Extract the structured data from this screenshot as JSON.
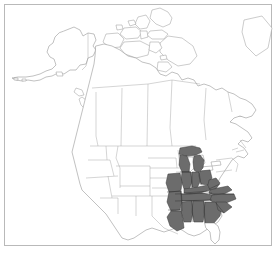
{
  "figure": {
    "kind": "distribution-range-map",
    "title": "",
    "caption": "",
    "width": 278,
    "height": 253
  },
  "frame": {
    "visible": true,
    "border_color": "#b9b9b9",
    "background_color": "#ffffff"
  },
  "style": {
    "background": "#ffffff",
    "coastline_stroke": "#8e8e8e",
    "admin_boundary_stroke": "#a2a2a2",
    "shaded_fill": "#6c6c6c",
    "shaded_stroke": "#3a3a3a",
    "unshaded_fill": "#ffffff"
  },
  "legend": {
    "visible": false,
    "entries": []
  },
  "map": {
    "extent_label": "North America",
    "projection_note": "",
    "regions": [
      {
        "name": "Alaska",
        "shaded": false
      },
      {
        "name": "Canada",
        "shaded": false
      },
      {
        "name": "Greenland",
        "shaded": false
      },
      {
        "name": "Mexico",
        "shaded": false
      },
      {
        "name": "Contiguous United States",
        "shaded": "partial"
      }
    ]
  },
  "range": {
    "label": "Shaded range",
    "color": "#6c6c6c",
    "description": "Southeastern and east-central United States",
    "states_shaded": [
      "Michigan",
      "Wisconsin",
      "Illinois",
      "Indiana",
      "Ohio",
      "Kentucky",
      "Tennessee",
      "Missouri",
      "Arkansas",
      "Louisiana",
      "Mississippi",
      "Alabama",
      "Georgia",
      "South Carolina",
      "North Carolina",
      "Virginia",
      "West Virginia"
    ],
    "states_unshaded_notable": [
      "Florida",
      "Texas",
      "Minnesota",
      "Iowa",
      "Pennsylvania",
      "New York",
      "Maine"
    ]
  },
  "annotations": [],
  "axes": {
    "visible": false
  }
}
